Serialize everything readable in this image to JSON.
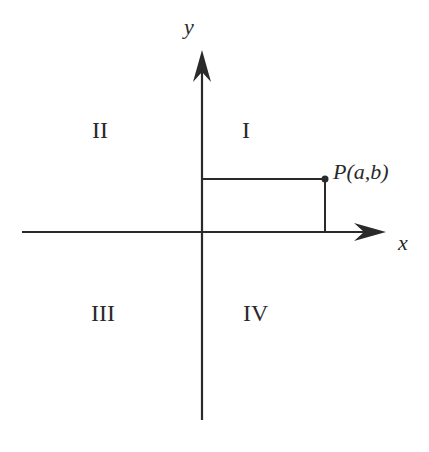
{
  "diagram": {
    "axes": {
      "x_label": "x",
      "y_label": "y"
    },
    "quadrants": [
      {
        "id": "I",
        "label": "I"
      },
      {
        "id": "II",
        "label": "II"
      },
      {
        "id": "III",
        "label": "III"
      },
      {
        "id": "IV",
        "label": "IV"
      }
    ],
    "point": {
      "label": "P(a,b)",
      "name": "P",
      "coords": "(a,b)"
    },
    "colors": {
      "ink": "#2a2a2a",
      "background": "#ffffff"
    }
  }
}
